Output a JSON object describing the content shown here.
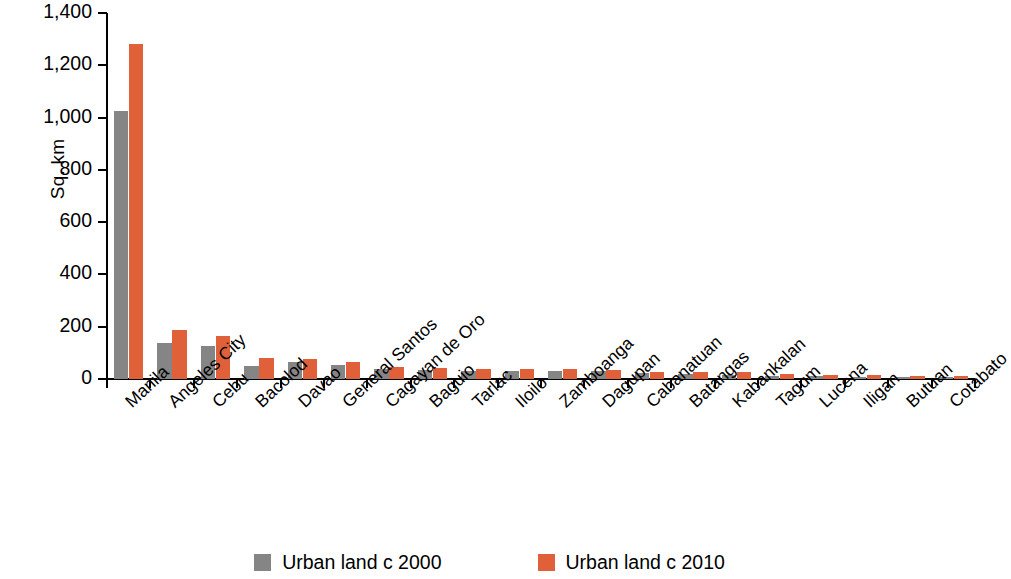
{
  "chart_data": {
    "type": "bar",
    "title": "",
    "subtitle": "",
    "xlabel": "",
    "ylabel": "Sq. km",
    "ylim": [
      0,
      1400
    ],
    "yticks": [
      0,
      200,
      400,
      600,
      800,
      1000,
      1200,
      1400
    ],
    "ytick_labels": [
      "0",
      "200",
      "400",
      "600",
      "800",
      "1,000",
      "1,200",
      "1,400"
    ],
    "grid": false,
    "legend_position": "bottom-center",
    "categories": [
      "Manila",
      "Angeles City",
      "Cebu",
      "Bacolod",
      "Davao",
      "General Santos",
      "Cagayan de Oro",
      "Baguio",
      "Tarlac",
      "Iloilo",
      "Zamboanga",
      "Dagupan",
      "Cabanatuan",
      "Batangas",
      "Kabankalan",
      "Tagum",
      "Lucena",
      "Iligan",
      "Butuan",
      "Cotabato"
    ],
    "series": [
      {
        "name": "Urban land c 2000",
        "color": "#858585",
        "values": [
          1025,
          137,
          125,
          48,
          66,
          55,
          37,
          34,
          30,
          32,
          30,
          31,
          23,
          19,
          14,
          12,
          11,
          9,
          7,
          6
        ]
      },
      {
        "name": "Urban land c 2010",
        "color": "#e0603a",
        "values": [
          1280,
          188,
          165,
          80,
          76,
          64,
          46,
          43,
          37,
          39,
          38,
          35,
          28,
          26,
          25,
          20,
          17,
          15,
          13,
          12
        ]
      }
    ]
  },
  "legend": {
    "items": [
      {
        "label": "Urban land c 2000",
        "color": "#858585"
      },
      {
        "label": "Urban land c 2010",
        "color": "#e0603a"
      }
    ]
  }
}
